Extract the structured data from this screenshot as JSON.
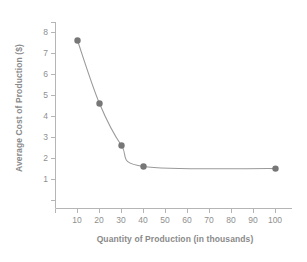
{
  "chart_data": {
    "type": "line",
    "title": "",
    "xlabel": "Quantity of Production (in thousands)",
    "ylabel": "Average Cost of Production ($)",
    "x": [
      10,
      20,
      30,
      40,
      100
    ],
    "values": [
      8,
      5,
      3,
      2,
      1.9
    ],
    "series": [
      {
        "name": "Average Cost of Production",
        "x": [
          10,
          20,
          30,
          40,
          100
        ],
        "values": [
          8,
          5,
          3,
          2,
          1.9
        ]
      }
    ],
    "xlim": [
      0,
      110
    ],
    "ylim": [
      0,
      8.6
    ],
    "xticks": [
      10,
      20,
      30,
      40,
      50,
      60,
      70,
      80,
      90,
      100
    ],
    "yticks": [
      1,
      2,
      3,
      4,
      5,
      6,
      7,
      8
    ],
    "xtick_labels": [
      "10",
      "20",
      "30",
      "40",
      "50",
      "60",
      "70",
      "80",
      "90",
      "100"
    ],
    "ytick_labels": [
      "1",
      "2",
      "3",
      "4",
      "5",
      "6",
      "7",
      "8"
    ],
    "grid": false,
    "legend": null,
    "marker": "circle",
    "marker_color": "#777777",
    "line_color": "#9a9a9a",
    "axis_color": "#b0b0b0",
    "text_color": "#8a8a8a",
    "background": "#ffffff"
  },
  "axes": {
    "y_title": "Average Cost of Production ($)",
    "x_title": "Quantity of Production (in thousands)"
  }
}
